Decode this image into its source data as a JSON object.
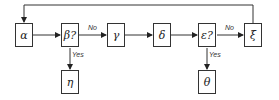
{
  "diagram": {
    "nodes": [
      {
        "id": "alpha",
        "label": "α"
      },
      {
        "id": "beta",
        "label": "β?"
      },
      {
        "id": "gamma",
        "label": "γ"
      },
      {
        "id": "delta",
        "label": "δ"
      },
      {
        "id": "epsilon",
        "label": "ε?"
      },
      {
        "id": "xi",
        "label": "ξ"
      },
      {
        "id": "eta",
        "label": "η"
      },
      {
        "id": "theta",
        "label": "θ"
      }
    ],
    "edges": [
      {
        "from": "alpha",
        "to": "beta",
        "label": ""
      },
      {
        "from": "beta",
        "to": "gamma",
        "label": "No"
      },
      {
        "from": "beta",
        "to": "eta",
        "label": "Yes"
      },
      {
        "from": "gamma",
        "to": "delta",
        "label": ""
      },
      {
        "from": "delta",
        "to": "epsilon",
        "label": ""
      },
      {
        "from": "epsilon",
        "to": "xi",
        "label": "No"
      },
      {
        "from": "epsilon",
        "to": "theta",
        "label": "Yes"
      },
      {
        "from": "xi",
        "to": "alpha",
        "label": ""
      }
    ],
    "labels": {
      "beta_no": "No",
      "beta_yes": "Yes",
      "epsilon_no": "No",
      "epsilon_yes": "Yes"
    }
  }
}
